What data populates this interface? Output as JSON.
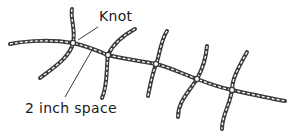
{
  "figure": {
    "labels": {
      "knot": "Knot",
      "space": "2 inch space"
    },
    "colors": {
      "stroke": "#3a3a3a",
      "highlight": "#ffffff",
      "background": "#ffffff"
    },
    "main_strand": {
      "path": "M10,44 C30,40 55,40 73,43 C90,47 100,52 108,55 C125,59 140,61 156,64 C172,68 185,75 197,79 C210,84 222,88 232,90 C250,94 268,98 285,101"
    },
    "knots": [
      {
        "x": 73,
        "y": 43
      },
      {
        "x": 108,
        "y": 55
      },
      {
        "x": 156,
        "y": 64
      },
      {
        "x": 197,
        "y": 79
      },
      {
        "x": 232,
        "y": 90
      }
    ],
    "branches": [
      {
        "path": "M72,9 C70,18 76,30 73,43 C70,58 50,70 40,78"
      },
      {
        "path": "M135,29 C122,36 112,46 108,55 C106,68 108,85 102,98"
      },
      {
        "path": "M167,31 C160,42 160,55 156,64 C152,75 150,86 148,96"
      },
      {
        "path": "M207,46 C206,58 202,70 197,79 C188,93 178,102 178,117"
      },
      {
        "path": "M247,52 C240,65 232,78 232,90 C230,105 222,115 222,129"
      }
    ],
    "leaders": [
      {
        "name": "knot-leader",
        "x1": 98,
        "y1": 27,
        "x2": 78,
        "y2": 40
      },
      {
        "name": "space-leader",
        "x1": 65,
        "y1": 97,
        "x2": 92,
        "y2": 50
      }
    ]
  }
}
